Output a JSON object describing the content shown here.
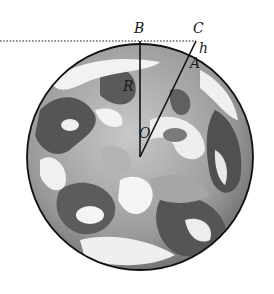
{
  "figure": {
    "labels": {
      "B": "B",
      "C": "C",
      "h": "h",
      "A": "A",
      "R": "R",
      "O": "O"
    },
    "geometry": {
      "center": [
        140,
        157
      ],
      "radius": 113,
      "point_B": [
        140,
        41
      ],
      "point_C": [
        196,
        41
      ],
      "point_A": [
        188,
        63
      ],
      "tangent_line_start_x": 0
    },
    "colors": {
      "outline": "#111111",
      "land_dark": "#5a5a5a",
      "land_mid": "#8c8c8c",
      "cloud": "#f0f0f0",
      "ocean": "#a9a9a9"
    }
  }
}
